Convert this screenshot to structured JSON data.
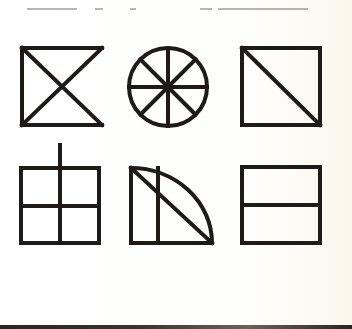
{
  "figure": {
    "stroke_color": "#1e1a18",
    "background_color": "#ffffff",
    "stroke_width": 4,
    "shapes": [
      {
        "id": "bowtie-square",
        "row": 1,
        "col": 1,
        "label": "Square missing right side with crossed diagonals"
      },
      {
        "id": "wheel",
        "row": 1,
        "col": 2,
        "label": "Circle with eight spokes"
      },
      {
        "id": "square-diagonal",
        "row": 1,
        "col": 3,
        "label": "Square with one diagonal"
      },
      {
        "id": "four-pane-grid",
        "row": 2,
        "col": 1,
        "label": "Square divided into four with extended vertical line"
      },
      {
        "id": "quarter-circle",
        "row": 2,
        "col": 2,
        "label": "Quarter circle with vertical line and diagonal"
      },
      {
        "id": "square-halved",
        "row": 2,
        "col": 3,
        "label": "Square divided horizontally in half"
      }
    ]
  }
}
